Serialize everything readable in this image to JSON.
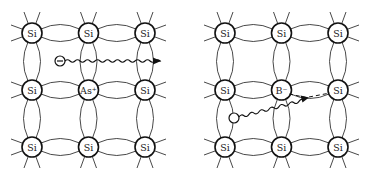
{
  "diagram": {
    "panels": [
      {
        "name": "n-type",
        "dopant_label": "As⁺",
        "atoms": [
          [
            "Si",
            "Si",
            "Si"
          ],
          [
            "Si",
            "As⁺",
            "Si"
          ],
          [
            "Si",
            "Si",
            "Si"
          ]
        ],
        "carrier": {
          "type": "electron",
          "symbol": "−"
        },
        "origin_x": 32
      },
      {
        "name": "p-type",
        "dopant_label": "B⁻",
        "atoms": [
          [
            "Si",
            "Si",
            "Si"
          ],
          [
            "Si",
            "B⁻",
            "Si"
          ],
          [
            "Si",
            "Si",
            "Si"
          ]
        ],
        "carrier": {
          "type": "hole",
          "symbol": ""
        },
        "origin_x": 225
      }
    ],
    "colors": {
      "line": "#333333",
      "atom_stroke": "#111111",
      "background": "#ffffff"
    }
  }
}
